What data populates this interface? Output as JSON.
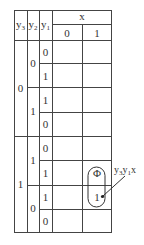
{
  "table": {
    "header": {
      "col_vars": [
        "y3",
        "y2",
        "y1"
      ],
      "x_label": "x",
      "x_values": [
        "0",
        "1"
      ]
    },
    "y3_groups": [
      {
        "value": "0"
      },
      {
        "value": "1"
      }
    ],
    "y2_groups": [
      {
        "value": "0"
      },
      {
        "value": "1"
      },
      {
        "value": "1"
      },
      {
        "value": "0"
      }
    ],
    "y1_values": [
      "0",
      "1",
      "1",
      "0",
      "0",
      "1",
      "1",
      "0"
    ],
    "cells": [
      [
        "",
        ""
      ],
      [
        "",
        ""
      ],
      [
        "",
        ""
      ],
      [
        "",
        ""
      ],
      [
        "",
        ""
      ],
      [
        "",
        "Φ"
      ],
      [
        "",
        "1"
      ],
      [
        "",
        ""
      ]
    ]
  },
  "grouping": {
    "label_main": "y",
    "label": "y3y1x",
    "parts": [
      {
        "v": "y",
        "s": "3"
      },
      {
        "v": "y",
        "s": "1"
      },
      {
        "v": "x",
        "s": ""
      }
    ],
    "circled_cells": [
      "Φ",
      "1"
    ]
  }
}
